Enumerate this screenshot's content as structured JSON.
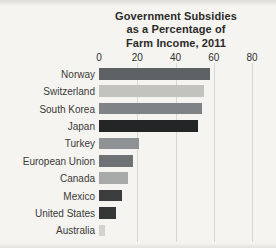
{
  "figure": {
    "background": "#f5f4f1",
    "text_color": "#2f2f2d",
    "label_color": "#3a3a37",
    "gridline_color": "#d8d7d3"
  },
  "chart_data": {
    "type": "bar",
    "orientation": "horizontal",
    "title_lines": [
      "Government Subsidies",
      "as a Percentage of",
      "Farm Income, 2011"
    ],
    "categories": [
      "Norway",
      "Switzerland",
      "South Korea",
      "Japan",
      "Turkey",
      "European Union",
      "Canada",
      "Mexico",
      "United States",
      "Australia"
    ],
    "values": [
      58,
      55,
      54,
      52,
      21,
      18,
      15,
      12,
      9,
      3
    ],
    "bar_colors": [
      "#5d6163",
      "#c2c2bf",
      "#808386",
      "#232526",
      "#8f9294",
      "#6e7274",
      "#a8aaa9",
      "#3a3c3e",
      "#343637",
      "#d2d2cf"
    ],
    "xlabel": "",
    "ylabel": "",
    "xlim": [
      0,
      80
    ],
    "xticks": [
      0,
      20,
      40,
      60,
      80
    ],
    "grid": "vertical-gridlines",
    "legend": "none",
    "unit": "percent of farm income"
  }
}
